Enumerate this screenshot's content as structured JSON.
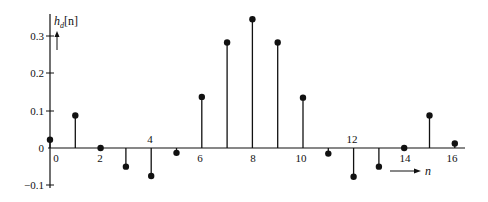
{
  "chart_data": {
    "type": "stem",
    "title": "",
    "ylabel": "h_d[n]",
    "xlabel": "n",
    "x": [
      0,
      1,
      2,
      3,
      4,
      5,
      6,
      7,
      8,
      9,
      10,
      11,
      12,
      13,
      14,
      15,
      16
    ],
    "values": [
      0.022,
      0.087,
      0.0,
      -0.05,
      -0.075,
      -0.013,
      0.137,
      0.283,
      0.345,
      0.283,
      0.135,
      -0.015,
      -0.077,
      -0.05,
      0.0,
      0.087,
      0.012
    ],
    "x_ticks": [
      "0",
      "2",
      "4",
      "6",
      "8",
      "10",
      "12",
      "14",
      "16"
    ],
    "y_ticks": [
      "0.3",
      "0.2",
      "0.1",
      "0",
      "-0.1"
    ],
    "ylim": [
      -0.1,
      0.35
    ],
    "xlim": [
      0,
      16.5
    ],
    "grid": false,
    "legend": null
  },
  "labels": {
    "ylabel_main": "h",
    "ylabel_sub": "d",
    "ylabel_arg": "[n]",
    "xlabel": "n",
    "y3": "0.3",
    "y2": "0.2",
    "y1": "0.1",
    "y0": "0",
    "ym1": "−0.1",
    "x0": "0",
    "x2": "2",
    "x4": "4",
    "x6": "6",
    "x8": "8",
    "x10": "10",
    "x12": "12",
    "x14": "14",
    "x16": "16"
  }
}
